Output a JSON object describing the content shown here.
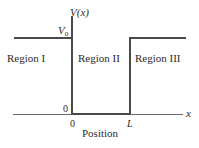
{
  "diagram": {
    "y_axis_label": "V(x)",
    "x_axis_label": "x",
    "x_axis_title": "Position",
    "v0_label": "V",
    "v0_subscript": "0",
    "zero_y_label": "0",
    "zero_x_label": "0",
    "L_label": "L",
    "regions": [
      {
        "label": "Region I"
      },
      {
        "label": "Region II"
      },
      {
        "label": "Region III"
      }
    ],
    "colors": {
      "potential_line": "#4a4a4a",
      "axis_line": "#6a6a6a",
      "text": "#2a2a2a"
    }
  }
}
